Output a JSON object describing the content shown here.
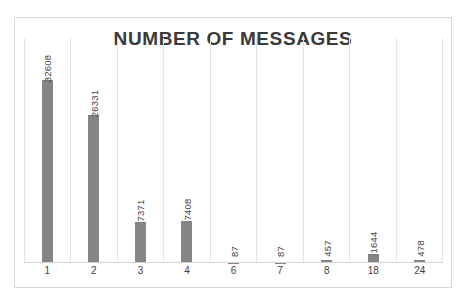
{
  "chart_data": {
    "type": "bar",
    "title": "NUMBER OF MESSAGES",
    "xlabel": "",
    "ylabel": "",
    "categories": [
      "1",
      "2",
      "3",
      "4",
      "6",
      "7",
      "8",
      "18",
      "24"
    ],
    "values": [
      32608,
      26331,
      7371,
      7408,
      87,
      87,
      457,
      1644,
      478
    ],
    "data_labels": [
      "32608",
      "26331",
      "7371",
      "7408",
      "87",
      "87",
      "457",
      "1644",
      "478"
    ],
    "data_label_rotation": -90,
    "ylim": [
      0,
      40000
    ],
    "grid": {
      "vertical": true,
      "horizontal": false,
      "color": "#e4e4e4"
    },
    "legend": null,
    "bar_color": "#858585",
    "title_color": "#3a3a3a",
    "axis_text_color": "#3f3f3f",
    "plot_border_color": "#d9d9d9",
    "baseline_color": "#d4d4d4",
    "background": "#ffffff"
  }
}
